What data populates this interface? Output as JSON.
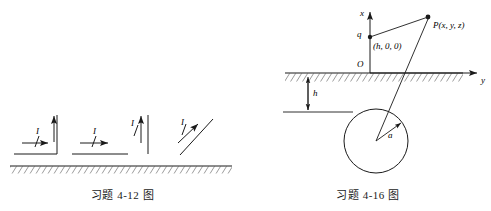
{
  "page": {
    "width": 491,
    "height": 211,
    "background": "#ffffff",
    "ink": "#1a1a1a"
  },
  "figure_left": {
    "name": "problem-4-12-figure",
    "caption": "习题 4-12 图",
    "ground": {
      "label": "hatched-ground-plane",
      "hatch_direction": "up-right"
    },
    "conductors": [
      {
        "id": "right-angle-conductor",
        "shape": "L-bend, horizontal arm entering from left, vertical arm rising at the corner",
        "current_label": "I",
        "arrows": [
          "horizontal-right",
          "vertical-up"
        ]
      },
      {
        "id": "horizontal-conductor",
        "shape": "straight horizontal wire parallel to ground",
        "current_label": "I",
        "arrows": [
          "horizontal-right"
        ]
      },
      {
        "id": "vertical-conductor",
        "shape": "straight vertical wire perpendicular to ground",
        "current_label": "I",
        "arrows": [
          "vertical-up"
        ]
      },
      {
        "id": "oblique-conductor",
        "shape": "straight wire inclined about 45 degrees to the ground",
        "current_label": "I",
        "arrows": [
          "diagonal-up-right"
        ]
      }
    ]
  },
  "figure_right": {
    "name": "problem-4-16-figure",
    "caption": "习题 4-16 图",
    "axes": {
      "x_label": "x",
      "y_label": "y",
      "origin_label": "O"
    },
    "ground": {
      "label": "hatched-ground-plane",
      "hatch_direction": "up-right"
    },
    "points": [
      {
        "id": "charge-point",
        "label": "q",
        "coordinates_label": "(h, 0, 0)"
      },
      {
        "id": "field-point",
        "label": "P(x, y, z)"
      }
    ],
    "dimensions": [
      {
        "id": "depth-dimension",
        "label": "h",
        "description": "vertical distance from ground plane down to the top level of the sphere"
      },
      {
        "id": "radius-dimension",
        "label": "a",
        "description": "radius arrow from circle centre to circumference"
      }
    ],
    "sphere": {
      "id": "buried-sphere",
      "label": "circle representing a buried spherical conductor"
    }
  }
}
